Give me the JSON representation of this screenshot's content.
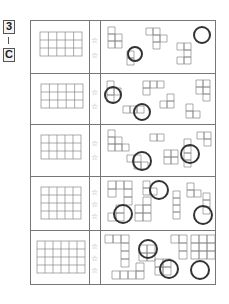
{
  "header": {
    "number": "3",
    "separator": "|",
    "letter": "C"
  },
  "colors": {
    "line": "#777777",
    "grid": "#888888",
    "circle": "#333333",
    "star": "#999999"
  },
  "rows": [
    {
      "grid": {
        "cols": 5,
        "rows": 3
      },
      "stars": 2,
      "star_glyph": "☆",
      "circles": 2
    },
    {
      "grid": {
        "cols": 5,
        "rows": 3
      },
      "stars": 2,
      "star_glyph": "☆",
      "circles": 2
    },
    {
      "grid": {
        "cols": 5,
        "rows": 3
      },
      "stars": 2,
      "star_glyph": "☆",
      "circles": 2
    },
    {
      "grid": {
        "cols": 5,
        "rows": 4
      },
      "stars": 3,
      "star_glyph": "☆",
      "circles": 3
    },
    {
      "grid": {
        "cols": 6,
        "rows": 4
      },
      "stars": 3,
      "star_glyph": "☆",
      "circles": 3
    }
  ]
}
